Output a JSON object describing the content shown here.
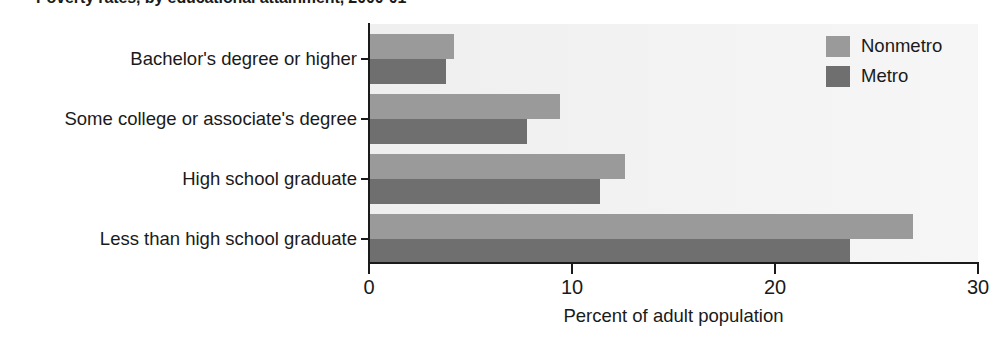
{
  "chart_data": {
    "type": "bar",
    "orientation": "horizontal",
    "title": "Poverty rates, by educational attainment, 2000-01",
    "xlabel": "Percent of adult population",
    "ylabel": "",
    "xlim": [
      0,
      30
    ],
    "xticks": [
      0,
      10,
      20,
      30
    ],
    "xtick_labels": [
      "0",
      "10",
      "20",
      "30"
    ],
    "grid": false,
    "legend_position": "top-right",
    "categories": [
      "Bachelor's degree or higher",
      "Some college or associate's degree",
      "High school graduate",
      "Less than high school graduate"
    ],
    "series": [
      {
        "name": "Nonmetro",
        "color": "#9a9a9a",
        "values": [
          4.2,
          9.4,
          12.6,
          26.8
        ]
      },
      {
        "name": "Metro",
        "color": "#6f6f6f",
        "values": [
          3.8,
          7.8,
          11.4,
          23.7
        ]
      }
    ]
  },
  "legend": {
    "items": [
      {
        "label": "Nonmetro",
        "color": "#9a9a9a"
      },
      {
        "label": "Metro",
        "color": "#6f6f6f"
      }
    ]
  },
  "colors": {
    "nonmetro": "#9a9a9a",
    "metro": "#6f6f6f",
    "axis": "#1a1a1a",
    "plot_background": "#f2f2f2",
    "page_background": "#ffffff"
  }
}
